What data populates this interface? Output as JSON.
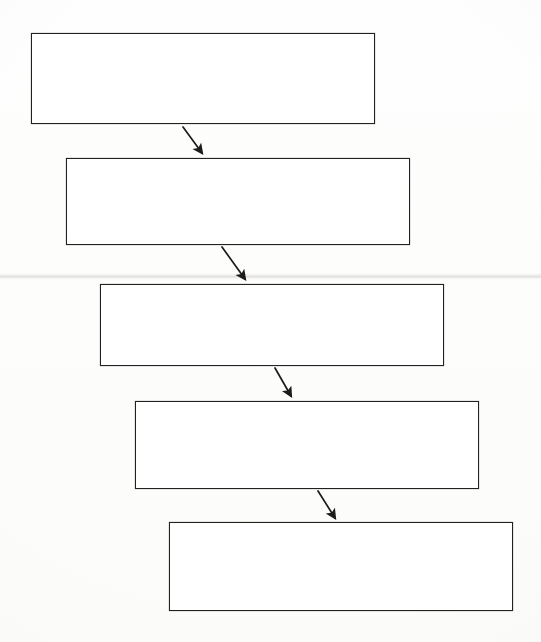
{
  "document": {
    "kind": "flowchart-diagram",
    "background_color": "#fdfdfc",
    "stroke_color": "#22211f",
    "fill_color": "#ffffff",
    "width": 541,
    "height": 642
  },
  "artifacts": {
    "scan_seam": {
      "name": "scanner-seam-line",
      "y": 276,
      "color": "#bab8b4",
      "visible": true
    }
  },
  "diagram": {
    "title": "",
    "orientation": "top-to-bottom cascade",
    "nodes": [
      {
        "id": "box-1",
        "label": "",
        "x": 31,
        "y": 33,
        "w": 344,
        "h": 91
      },
      {
        "id": "box-2",
        "label": "",
        "x": 66,
        "y": 158,
        "w": 344,
        "h": 87
      },
      {
        "id": "box-3",
        "label": "",
        "x": 100,
        "y": 284,
        "w": 344,
        "h": 82
      },
      {
        "id": "box-4",
        "label": "",
        "x": 135,
        "y": 401,
        "w": 344,
        "h": 88
      },
      {
        "id": "box-5",
        "label": "",
        "x": 169,
        "y": 522,
        "w": 344,
        "h": 89
      }
    ],
    "edges": [
      {
        "id": "arrow-1",
        "from": "box-1",
        "to": "box-2",
        "x1": 183,
        "y1": 127,
        "x2": 203,
        "y2": 155,
        "style": "solid-diagonal-arrow"
      },
      {
        "id": "arrow-2",
        "from": "box-2",
        "to": "box-3",
        "x1": 222,
        "y1": 247,
        "x2": 246,
        "y2": 281,
        "style": "solid-diagonal-arrow"
      },
      {
        "id": "arrow-3",
        "from": "box-3",
        "to": "box-4",
        "x1": 275,
        "y1": 368,
        "x2": 292,
        "y2": 398,
        "style": "solid-diagonal-arrow"
      },
      {
        "id": "arrow-4",
        "from": "box-4",
        "to": "box-5",
        "x1": 318,
        "y1": 491,
        "x2": 336,
        "y2": 520,
        "style": "solid-diagonal-arrow"
      }
    ]
  }
}
